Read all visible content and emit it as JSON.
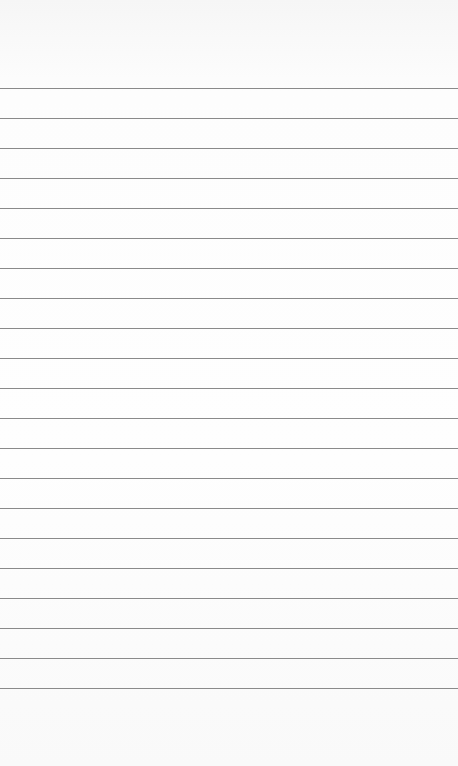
{
  "paper": {
    "type": "lined-paper",
    "background_color": "#fbfbfb",
    "line_color": "#8a8a8a",
    "first_line_y": 88,
    "line_spacing": 30,
    "line_count": 21
  }
}
